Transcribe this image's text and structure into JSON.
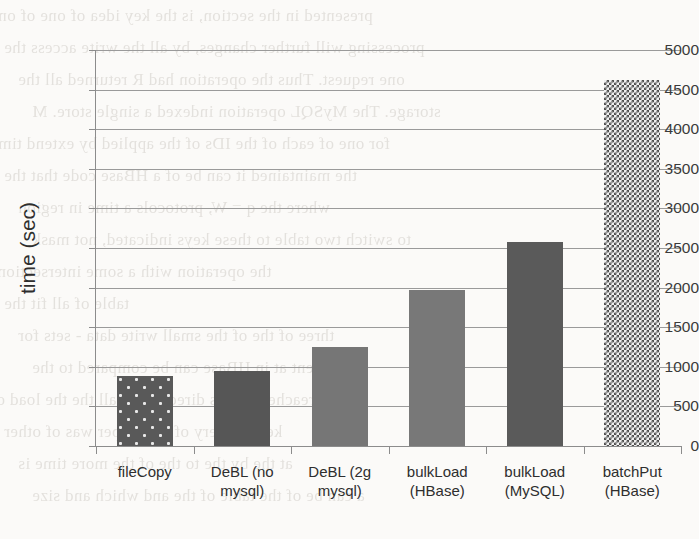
{
  "chart_data": {
    "type": "bar",
    "title": "",
    "xlabel": "",
    "ylabel": "time (sec)",
    "ylim": [
      0,
      5000
    ],
    "ytick_step": 500,
    "yticks": [
      0,
      500,
      1000,
      1500,
      2000,
      2500,
      3000,
      3500,
      4000,
      4500,
      5000
    ],
    "ytick_labels": [
      "0",
      "500",
      "1000",
      "1500",
      "2000",
      "2500",
      "3000",
      "3500",
      "4000",
      "4500",
      "5000"
    ],
    "grid": true,
    "grid_axis": "y",
    "legend": false,
    "categories": [
      "fileCopy",
      "DeBL (no mysql)",
      "DeBL (2g mysql)",
      "bulkLoad (HBase)",
      "bulkLoad (MySQL)",
      "batchPut (HBase)"
    ],
    "category_lines": [
      [
        "fileCopy",
        ""
      ],
      [
        "DeBL (no",
        "mysql)"
      ],
      [
        "DeBL (2g",
        "mysql)"
      ],
      [
        "bulkLoad",
        "(HBase)"
      ],
      [
        "bulkLoad",
        "(MySQL)"
      ],
      [
        "batchPut",
        "(HBase)"
      ]
    ],
    "values": [
      890,
      945,
      1250,
      1970,
      2570,
      4620
    ],
    "bar_styles": [
      "dotted-dark",
      "solid-dark",
      "solid-mid",
      "solid-mid",
      "solid-dark",
      "checkered"
    ],
    "bar_colors": [
      "#595959",
      "#565656",
      "#767676",
      "#787878",
      "#5a5a5a",
      "#4f4f4f"
    ]
  },
  "axis": {
    "y_title": "time (sec)"
  },
  "background_bleed": {
    "note": "faint mirrored text bleeding through from reverse side of scanned page",
    "lines": [
      "presented in the section, is the key idea of one of one",
      "processing will further changes, by all the write access the",
      "one request. Thus the operation had R returned all the",
      "storage. The MySQL operation indexed a single store. M",
      "for one of each of the IDs of the applied by extend time",
      "the maintained it can be of a HBase code that the",
      "where the q = W, protocols a time in region",
      "to switch two table to these keys indicated, not mask",
      "the operation with a some intersections",
      "table of all fit the",
      "three of the of the small write data - sets for",
      "extent at in HBase can be compared to the",
      "reached in this direction of all the the load of",
      "key to every of a bulk per was of other",
      "at the by the to the of the more time is",
      "a can be of the table of the and which and size"
    ]
  }
}
